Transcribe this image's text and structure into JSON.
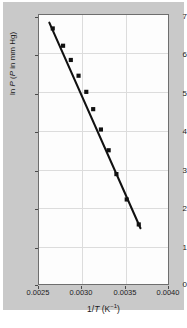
{
  "chart_data": {
    "type": "scatter",
    "title": "",
    "xlabel": "1/T (K−1)",
    "xlabel_parts": {
      "prefix": "1/",
      "italic": "T",
      "suffix": " (K",
      "sup": "−1",
      "tail": ")"
    },
    "ylabel": "ln P (P in mm Hg)",
    "ylabel_parts": {
      "prefix": "ln ",
      "italic1": "P",
      "mid": " (",
      "italic2": "P",
      "suffix": " in mm Hg)"
    },
    "xlim": [
      0.0025,
      0.004
    ],
    "ylim": [
      0,
      7
    ],
    "xticks": [
      0.0025,
      0.003,
      0.0035,
      0.004
    ],
    "xtick_labels": [
      "0.0025",
      "0.0030",
      "0.0035",
      "0.0040"
    ],
    "yticks": [
      0,
      1,
      2,
      3,
      4,
      5,
      6,
      7
    ],
    "ytick_labels": [
      "0",
      "1",
      "2",
      "3",
      "4",
      "5",
      "6",
      "7"
    ],
    "grid": true,
    "legend": "none",
    "series_name": "ln P vs 1/T",
    "marker": "filled-square",
    "marker_color": "#111111",
    "line_color": "#111111",
    "x": [
      0.00266,
      0.00278,
      0.00287,
      0.00296,
      0.00305,
      0.00313,
      0.00322,
      0.00331,
      0.0034,
      0.00352,
      0.00366
    ],
    "y": [
      6.65,
      6.2,
      5.83,
      5.42,
      5.0,
      4.55,
      4.02,
      3.48,
      2.86,
      2.2,
      1.55
    ],
    "fit_line": {
      "x": [
        0.00262,
        0.00368
      ],
      "y": [
        6.8,
        1.45
      ]
    }
  },
  "figure": {
    "background": "#ffffff",
    "mat_color": "#c9c9c9",
    "panel_color": "#fdfdfd",
    "frame_color": "#6e6e6e",
    "grid_color": "#dcdcdc"
  }
}
